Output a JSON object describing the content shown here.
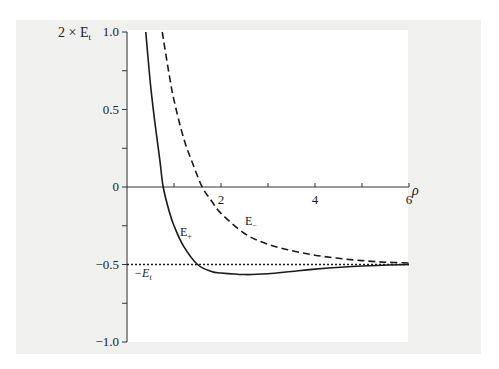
{
  "chart_data": {
    "type": "line",
    "title": "",
    "xlabel": "ρ",
    "ylabel": "2 × E_t",
    "xlim": [
      0,
      6
    ],
    "ylim": [
      -1.0,
      1.0
    ],
    "grid": false,
    "legend": "none (inline curve labels)",
    "x_ticks": [
      0,
      1,
      2,
      3,
      4,
      5,
      6
    ],
    "x_tick_labels": [
      "0",
      "",
      "2",
      "",
      "4",
      "",
      "6"
    ],
    "y_ticks": [
      -1.0,
      -0.75,
      -0.5,
      -0.25,
      0,
      0.25,
      0.5,
      0.75,
      1.0
    ],
    "y_tick_labels": [
      "−1.0",
      "",
      "−0.5",
      "",
      "0",
      "",
      "0.5",
      "",
      "1.0"
    ],
    "series": [
      {
        "name": "E+",
        "style": "solid",
        "x": [
          0.4,
          0.5,
          0.6,
          0.7,
          0.77,
          0.9,
          1.0,
          1.2,
          1.5,
          1.8,
          2.0,
          2.5,
          3.0,
          3.5,
          4.0,
          5.0,
          6.0
        ],
        "y": [
          1.0,
          0.66,
          0.4,
          0.17,
          0.0,
          -0.16,
          -0.25,
          -0.38,
          -0.5,
          -0.545,
          -0.555,
          -0.565,
          -0.56,
          -0.545,
          -0.53,
          -0.51,
          -0.5
        ]
      },
      {
        "name": "E-",
        "style": "dashed",
        "x": [
          0.75,
          0.9,
          1.0,
          1.2,
          1.4,
          1.6,
          1.8,
          2.0,
          2.5,
          3.0,
          3.5,
          4.0,
          4.5,
          5.0,
          5.5,
          6.0
        ],
        "y": [
          1.0,
          0.72,
          0.56,
          0.32,
          0.15,
          0.0,
          -0.09,
          -0.17,
          -0.3,
          -0.37,
          -0.41,
          -0.44,
          -0.46,
          -0.475,
          -0.485,
          -0.49
        ]
      },
      {
        "name": "−E_t",
        "style": "dotted",
        "x": [
          0,
          6
        ],
        "y": [
          -0.5,
          -0.5
        ]
      }
    ],
    "annotations": [
      {
        "text": "E+",
        "x": 1.15,
        "y": -0.3
      },
      {
        "text": "E−",
        "x": 2.55,
        "y": -0.22
      },
      {
        "text": "−E_t",
        "x": 0.2,
        "y": -0.56
      }
    ]
  },
  "labels": {
    "y_axis_main": "2 × E",
    "y_axis_sub": "t",
    "x_axis": "ρ",
    "e_plus_main": "E",
    "e_plus_sub": "+",
    "e_minus_main": "E",
    "e_minus_sub": "−",
    "neg_et_main": "−E",
    "neg_et_sub": "t"
  }
}
